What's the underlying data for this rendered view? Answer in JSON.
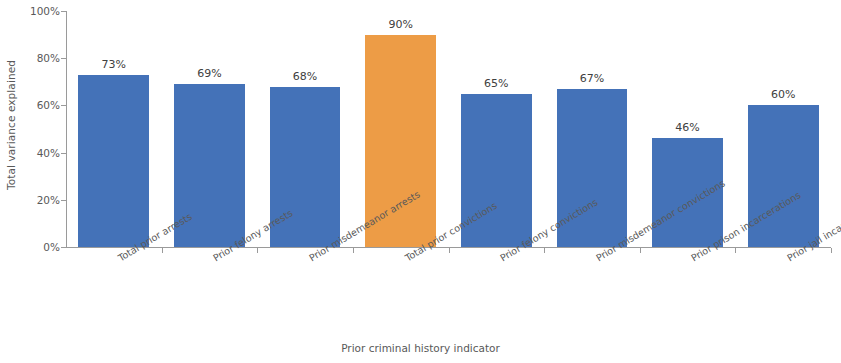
{
  "chart_data": {
    "type": "bar",
    "title": "",
    "xlabel": "Prior criminal history indicator",
    "ylabel": "Total variance explained",
    "categories": [
      "Total prior arrests",
      "Prior felony arrests",
      "Prior misdemeanor arrests",
      "Total prior convictions",
      "Prior felony convictions",
      "Prior misdemeanor convictions",
      "Prior prison incarcerations",
      "Prior jail incarcerations"
    ],
    "values": [
      73,
      69,
      68,
      90,
      65,
      67,
      46,
      60
    ],
    "value_labels": [
      "73%",
      "69%",
      "68%",
      "90%",
      "65%",
      "67%",
      "46%",
      "60%"
    ],
    "highlight_index": 3,
    "ylim": [
      0,
      100
    ],
    "ytick_values": [
      0,
      20,
      40,
      60,
      80,
      100
    ],
    "ytick_labels": [
      "0%",
      "20%",
      "40%",
      "60%",
      "80%",
      "100%"
    ],
    "grid": false,
    "legend": null,
    "colors": {
      "bar": "#4472b8",
      "highlight_bar": "#ed9c46",
      "axis": "#9a9a9a",
      "label_text": "#595959",
      "value_text": "#404040",
      "background": "#ffffff"
    }
  }
}
